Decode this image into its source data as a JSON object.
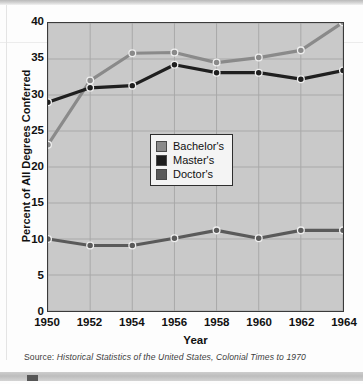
{
  "chart_data": {
    "type": "line",
    "title": "",
    "xlabel": "Year",
    "ylabel": "Percent of All Degrees Conferred",
    "x": [
      1950,
      1952,
      1954,
      1956,
      1958,
      1960,
      1962,
      1964
    ],
    "xtick_labels": [
      "1950",
      "1952",
      "1954",
      "1956",
      "1958",
      "1960",
      "1962",
      "1964"
    ],
    "ytick_labels": [
      "40",
      "35",
      "30",
      "25",
      "20",
      "15",
      "10",
      "5",
      "0"
    ],
    "xlim": [
      1950,
      1964
    ],
    "ylim": [
      0,
      40
    ],
    "grid": true,
    "legend_position": "center",
    "series": [
      {
        "name": "Bachelor's",
        "color": "#8a8a8a",
        "values": [
          23.1,
          32.0,
          35.8,
          35.9,
          34.5,
          35.2,
          36.2,
          40.1
        ]
      },
      {
        "name": "Master's",
        "color": "#1f1f1f",
        "values": [
          29.0,
          31.0,
          31.3,
          34.2,
          33.1,
          33.1,
          32.2,
          33.4
        ]
      },
      {
        "name": "Doctor's",
        "color": "#5a5a5a",
        "values": [
          10.0,
          9.1,
          9.1,
          10.1,
          11.2,
          10.1,
          11.2,
          11.2
        ]
      }
    ]
  },
  "source": {
    "label": "Source:",
    "text": " Historical Statistics of the United States, Colonial Times to 1970"
  },
  "colors": {
    "plot_background": "#c9c9c9",
    "axis": "#3a3a3a",
    "gridline": "#a8a8a8",
    "bachelors": "#8a8a8a",
    "masters": "#1f1f1f",
    "doctors": "#5a5a5a"
  }
}
